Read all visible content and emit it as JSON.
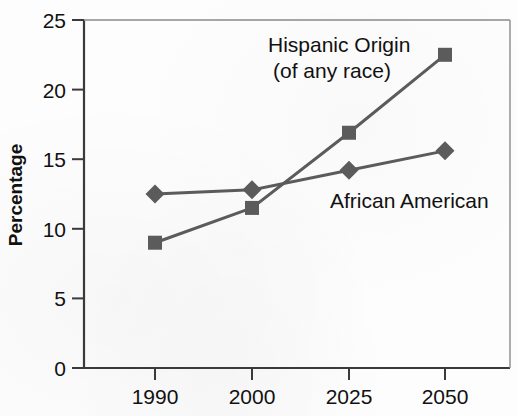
{
  "chart_data": {
    "type": "line",
    "title": "",
    "subtitle": "",
    "xlabel": "",
    "ylabel": "Percentage",
    "categories": [
      "1990",
      "2000",
      "2025",
      "2050"
    ],
    "xtick_labels": [
      "1990",
      "2000",
      "2025",
      "2050"
    ],
    "ytick_labels": [
      "0",
      "5",
      "10",
      "15",
      "20",
      "25"
    ],
    "ytick_values": [
      0,
      5,
      10,
      15,
      20,
      25
    ],
    "ylim": [
      0,
      25
    ],
    "grid": false,
    "legend_position": "inline-annotation",
    "series": [
      {
        "name": "Hispanic Origin (of any race)",
        "marker": "square",
        "color": "#5b5b5b",
        "values": [
          9.0,
          11.5,
          16.9,
          22.5
        ]
      },
      {
        "name": "African American",
        "marker": "diamond",
        "color": "#5b5b5b",
        "values": [
          12.5,
          12.8,
          14.2,
          15.6
        ]
      }
    ],
    "annotations": [
      {
        "id": "hispanic-origin",
        "line1": "Hispanic Origin",
        "line2": "(of any race)"
      },
      {
        "id": "african-american",
        "line1": "African American",
        "line2": ""
      }
    ]
  },
  "colors": {
    "axis": "#3a3a3a",
    "series": "#5b5b5b",
    "text": "#111111",
    "background": "#fdfdfd"
  }
}
